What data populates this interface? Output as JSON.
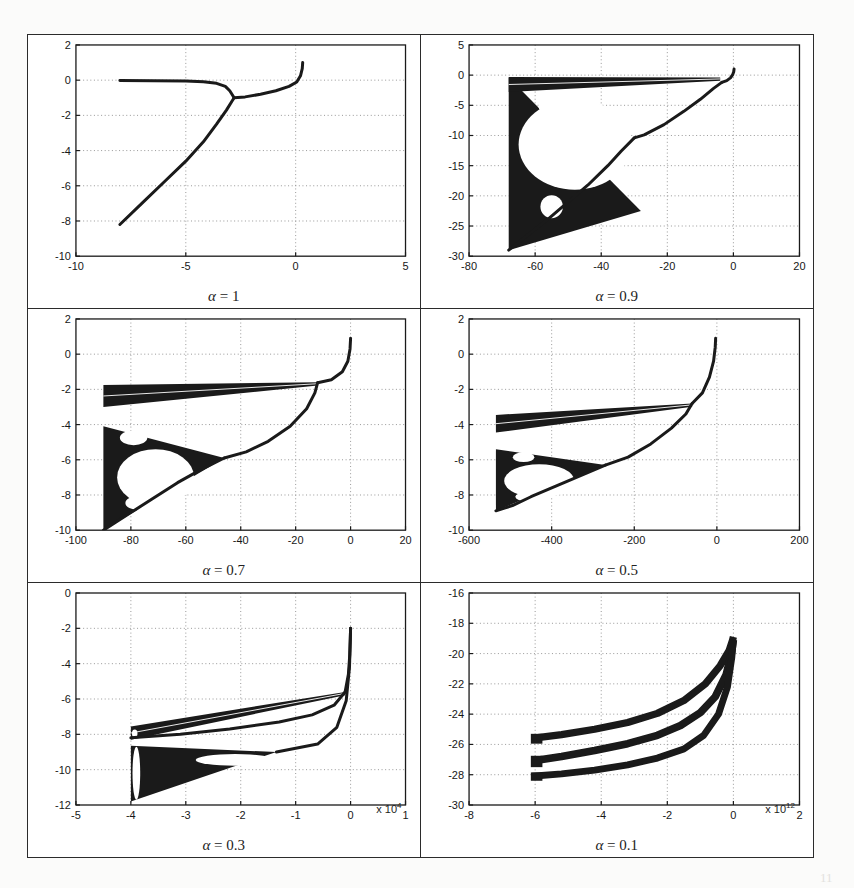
{
  "figure": {
    "kind": "bifurcation-diagram-grid",
    "rows": 3,
    "cols": 2,
    "background": "#ffffff",
    "ink": "#1a1a1a",
    "grid_color": "#9a9a9a"
  },
  "chart_data": [
    {
      "type": "scatter",
      "id": "panel-alpha-1",
      "title": "α = 1",
      "alpha_symbol": "α",
      "alpha_value": "1",
      "caption": "α = 1",
      "xlabel": "",
      "ylabel": "",
      "xlim": [
        -10,
        5
      ],
      "ylim": [
        -10,
        2
      ],
      "xticks": [
        -10,
        -5,
        0,
        5
      ],
      "xticklabels": [
        "-10",
        "-5",
        "0",
        "5"
      ],
      "yticks": [
        -10,
        -8,
        -6,
        -4,
        -2,
        0,
        2
      ],
      "yticklabels": [
        "-10",
        "-8",
        "-6",
        "-4",
        "-2",
        "0",
        "2"
      ],
      "grid": true,
      "x_exponent": "",
      "branches": [
        {
          "name": "flat-upper-branch",
          "points": [
            [
              -8.0,
              -0.02
            ],
            [
              -6.5,
              -0.03
            ],
            [
              -5.0,
              -0.05
            ],
            [
              -4.2,
              -0.09
            ],
            [
              -3.6,
              -0.18
            ],
            [
              -3.2,
              -0.35
            ],
            [
              -3.0,
              -0.6
            ],
            [
              -2.85,
              -0.9
            ],
            [
              -2.8,
              -1.0
            ]
          ]
        },
        {
          "name": "rising-right-branch",
          "points": [
            [
              -2.8,
              -1.0
            ],
            [
              -2.3,
              -0.95
            ],
            [
              -1.6,
              -0.8
            ],
            [
              -0.9,
              -0.6
            ],
            [
              -0.3,
              -0.35
            ],
            [
              0.05,
              -0.1
            ],
            [
              0.22,
              0.25
            ],
            [
              0.3,
              0.65
            ],
            [
              0.32,
              1.0
            ]
          ]
        },
        {
          "name": "diagonal-lower-branch",
          "points": [
            [
              -8.0,
              -8.2
            ],
            [
              -7.0,
              -7.0
            ],
            [
              -6.0,
              -5.8
            ],
            [
              -5.0,
              -4.6
            ],
            [
              -4.2,
              -3.5
            ],
            [
              -3.6,
              -2.5
            ],
            [
              -3.15,
              -1.7
            ],
            [
              -2.9,
              -1.2
            ],
            [
              -2.8,
              -1.0
            ]
          ]
        }
      ]
    },
    {
      "type": "scatter",
      "id": "panel-alpha-0-9",
      "title": "α = 0.9",
      "alpha_symbol": "α",
      "alpha_value": "0.9",
      "caption": "α = 0.9",
      "xlabel": "",
      "ylabel": "",
      "xlim": [
        -80,
        20
      ],
      "ylim": [
        -30,
        5
      ],
      "xticks": [
        -80,
        -60,
        -40,
        -20,
        0,
        20
      ],
      "xticklabels": [
        "-80",
        "-60",
        "-40",
        "-20",
        "0",
        "20"
      ],
      "yticks": [
        -30,
        -25,
        -20,
        -15,
        -10,
        -5,
        0,
        5
      ],
      "yticklabels": [
        "-30",
        "-25",
        "-20",
        "-15",
        "-10",
        "-5",
        "0",
        "5"
      ],
      "grid": true,
      "x_exponent": "",
      "chaotic_wedge": {
        "x_left": -68,
        "y_top": -0.4,
        "y_bottom": -29,
        "x_apex": -28,
        "y_apex": -22.5
      },
      "upper_band": {
        "x_left": -68,
        "x_right": -4,
        "y_left_top": -0.3,
        "y_left_bottom": -2.8,
        "y_right": -0.4
      },
      "eye_hole": {
        "cx": -48,
        "cy": -11.5,
        "rx": 17,
        "ry": 7.5
      },
      "small_hole": {
        "cx": -55,
        "cy": -21.8,
        "rx": 3.4,
        "ry": 1.9
      },
      "tiny_hole": {
        "cx": -56,
        "cy": -5.2,
        "rx": 3.0,
        "ry": 1.1
      },
      "branches": [
        {
          "name": "top-cusp",
          "points": [
            [
              -3.5,
              -1.2
            ],
            [
              -2.0,
              -0.9
            ],
            [
              -0.9,
              -0.45
            ],
            [
              -0.2,
              0.1
            ],
            [
              0.1,
              0.55
            ],
            [
              0.2,
              1.0
            ]
          ]
        },
        {
          "name": "right-descending",
          "points": [
            [
              -3.5,
              -1.2
            ],
            [
              -6,
              -2.2
            ],
            [
              -10,
              -4.0
            ],
            [
              -15,
              -6.0
            ],
            [
              -21,
              -8.2
            ],
            [
              -27,
              -9.9
            ],
            [
              -30,
              -10.4
            ]
          ]
        },
        {
          "name": "lower-right-arc",
          "points": [
            [
              -30,
              -10.4
            ],
            [
              -34,
              -12.6
            ],
            [
              -38,
              -15.0
            ],
            [
              -44,
              -18.2
            ],
            [
              -50,
              -21.0
            ],
            [
              -56,
              -23.8
            ],
            [
              -62,
              -26.4
            ],
            [
              -68,
              -29.0
            ]
          ]
        }
      ]
    },
    {
      "type": "scatter",
      "id": "panel-alpha-0-7",
      "title": "α = 0.7",
      "alpha_symbol": "α",
      "alpha_value": "0.7",
      "caption": "α = 0.7",
      "xlabel": "",
      "ylabel": "",
      "xlim": [
        -100,
        20
      ],
      "ylim": [
        -10,
        2
      ],
      "xticks": [
        -100,
        -80,
        -60,
        -40,
        -20,
        0,
        20
      ],
      "xticklabels": [
        "-100",
        "-80",
        "-60",
        "-40",
        "-20",
        "0",
        "20"
      ],
      "yticks": [
        -10,
        -8,
        -6,
        -4,
        -2,
        0,
        2
      ],
      "yticklabels": [
        "-10",
        "-8",
        "-6",
        "-4",
        "-2",
        "0",
        "2"
      ],
      "grid": true,
      "x_exponent": "",
      "upper_band": {
        "x_left": -90,
        "x_right": -12,
        "y_left_top": -1.75,
        "y_left_bottom": -3.0,
        "y_right": -1.6
      },
      "chaotic_wedge": {
        "x_left": -90,
        "y_top": -4.1,
        "y_bottom": -10.0,
        "x_apex": -46,
        "y_apex": -5.9
      },
      "eye_hole": {
        "cx": -71,
        "cy": -7.0,
        "rx": 14,
        "ry": 1.6
      },
      "small_hole": {
        "cx": -79,
        "cy": -4.75,
        "rx": 5.0,
        "ry": 0.42
      },
      "tiny_hole": {
        "cx": -77,
        "cy": -8.45,
        "rx": 5.0,
        "ry": 0.4
      },
      "branches": [
        {
          "name": "top-cusp",
          "points": [
            [
              -12,
              -1.62
            ],
            [
              -7,
              -1.45
            ],
            [
              -3,
              -1.0
            ],
            [
              -1,
              -0.4
            ],
            [
              -0.2,
              0.3
            ],
            [
              0.0,
              0.9
            ]
          ]
        },
        {
          "name": "right-descending",
          "points": [
            [
              -12,
              -1.62
            ],
            [
              -13,
              -2.2
            ],
            [
              -16,
              -3.1
            ],
            [
              -22,
              -4.1
            ],
            [
              -30,
              -4.95
            ],
            [
              -38,
              -5.55
            ],
            [
              -46,
              -5.9
            ]
          ]
        },
        {
          "name": "lower-right-arc",
          "points": [
            [
              -46,
              -5.9
            ],
            [
              -55,
              -6.6
            ],
            [
              -63,
              -7.3
            ],
            [
              -72,
              -8.2
            ],
            [
              -81,
              -9.1
            ],
            [
              -90,
              -10.0
            ]
          ]
        }
      ]
    },
    {
      "type": "scatter",
      "id": "panel-alpha-0-5",
      "title": "α = 0.5",
      "alpha_symbol": "α",
      "alpha_value": "0.5",
      "caption": "α = 0.5",
      "xlabel": "",
      "ylabel": "",
      "xlim": [
        -600,
        200
      ],
      "ylim": [
        -10,
        2
      ],
      "xticks": [
        -600,
        -400,
        -200,
        0,
        200
      ],
      "xticklabels": [
        "-600",
        "-400",
        "-200",
        "0",
        "200"
      ],
      "yticks": [
        -10,
        -8,
        -6,
        -4,
        -2,
        0,
        2
      ],
      "yticklabels": [
        "-10",
        "-8",
        "-6",
        "-4",
        "-2",
        "0",
        "2"
      ],
      "grid": true,
      "x_exponent": "",
      "upper_band": {
        "x_left": -535,
        "x_right": -60,
        "y_left_top": -3.45,
        "y_left_bottom": -4.45,
        "y_right": -2.8
      },
      "chaotic_wedge": {
        "x_left": -535,
        "y_top": -5.4,
        "y_bottom": -8.9,
        "x_apex": -270,
        "y_apex": -6.3
      },
      "eye_hole": {
        "cx": -430,
        "cy": -7.2,
        "rx": 85,
        "ry": 0.95
      },
      "small_hole": {
        "cx": -468,
        "cy": -5.85,
        "rx": 26,
        "ry": 0.28
      },
      "tiny_hole": {
        "cx": -460,
        "cy": -8.1,
        "rx": 28,
        "ry": 0.26
      },
      "branches": [
        {
          "name": "top-cusp",
          "points": [
            [
              -60,
              -2.8
            ],
            [
              -35,
              -2.2
            ],
            [
              -18,
              -1.3
            ],
            [
              -8,
              -0.4
            ],
            [
              -4,
              0.4
            ],
            [
              -3,
              0.9
            ]
          ]
        },
        {
          "name": "right-descending",
          "points": [
            [
              -60,
              -2.8
            ],
            [
              -75,
              -3.4
            ],
            [
              -110,
              -4.2
            ],
            [
              -160,
              -5.1
            ],
            [
              -215,
              -5.85
            ],
            [
              -270,
              -6.3
            ]
          ]
        },
        {
          "name": "lower-right-arc",
          "points": [
            [
              -270,
              -6.3
            ],
            [
              -330,
              -6.9
            ],
            [
              -390,
              -7.5
            ],
            [
              -450,
              -8.1
            ],
            [
              -495,
              -8.6
            ],
            [
              -535,
              -8.9
            ]
          ]
        }
      ]
    },
    {
      "type": "scatter",
      "id": "panel-alpha-0-3",
      "title": "α = 0.3",
      "alpha_symbol": "α",
      "alpha_value": "0.3",
      "caption": "α = 0.3",
      "xlabel": "",
      "ylabel": "",
      "xlim": [
        -5,
        1
      ],
      "ylim": [
        -12,
        0
      ],
      "xticks": [
        -5,
        -4,
        -3,
        -2,
        -1,
        0,
        1
      ],
      "xticklabels": [
        "-5",
        "-4",
        "-3",
        "-2",
        "-1",
        "0",
        "1"
      ],
      "yticks": [
        -12,
        -10,
        -8,
        -6,
        -4,
        -2,
        0
      ],
      "yticklabels": [
        "-12",
        "-10",
        "-8",
        "-6",
        "-4",
        "-2",
        "0"
      ],
      "grid": true,
      "x_exponent": "x 10",
      "x_exponent_power": "4",
      "upper_band": {
        "x_left": -4.0,
        "x_right": -0.1,
        "y_left_top": -7.55,
        "y_left_bottom": -8.3,
        "y_right": -5.6
      },
      "chaotic_wedge": {
        "x_left": -4.0,
        "y_top": -8.65,
        "y_bottom": -11.8,
        "x_apex": -1.35,
        "y_apex": -9.0
      },
      "eye_hole": {
        "cx": -2.1,
        "cy": -9.45,
        "rx": 0.72,
        "ry": 0.33
      },
      "small_hole": {
        "cx": -3.9,
        "cy": -10.2,
        "rx": 0.07,
        "ry": 1.5
      },
      "tiny_hole": {
        "cx": -3.93,
        "cy": -7.95,
        "rx": 0.05,
        "ry": 0.22
      },
      "branches": [
        {
          "name": "top-cusp",
          "points": [
            [
              -0.1,
              -5.6
            ],
            [
              -0.04,
              -4.6
            ],
            [
              -0.015,
              -3.5
            ],
            [
              -0.005,
              -2.6
            ],
            [
              0.0,
              -2.0
            ]
          ]
        },
        {
          "name": "right-descending",
          "points": [
            [
              -0.1,
              -5.6
            ],
            [
              -0.3,
              -6.35
            ],
            [
              -0.7,
              -6.9
            ],
            [
              -1.3,
              -7.3
            ],
            [
              -2.2,
              -7.7
            ],
            [
              -3.1,
              -8.0
            ],
            [
              -4.0,
              -8.2
            ]
          ]
        },
        {
          "name": "lower-right-arc",
          "points": [
            [
              0.0,
              -2.0
            ],
            [
              -0.02,
              -4.2
            ],
            [
              -0.08,
              -6.1
            ],
            [
              -0.25,
              -7.6
            ],
            [
              -0.6,
              -8.55
            ],
            [
              -1.35,
              -9.0
            ]
          ]
        }
      ]
    },
    {
      "type": "scatter",
      "id": "panel-alpha-0-1",
      "title": "α = 0.1",
      "alpha_symbol": "α",
      "alpha_value": "0.1",
      "caption": "α = 0.1",
      "xlabel": "",
      "ylabel": "",
      "xlim": [
        -8,
        2
      ],
      "ylim": [
        -30,
        -16
      ],
      "xticks": [
        -8,
        -6,
        -4,
        -2,
        0,
        2
      ],
      "xticklabels": [
        "-8",
        "-6",
        "-4",
        "-2",
        "0",
        "2"
      ],
      "yticks": [
        -30,
        -28,
        -26,
        -24,
        -22,
        -20,
        -18,
        -16
      ],
      "yticklabels": [
        "-30",
        "-28",
        "-26",
        "-24",
        "-22",
        "-20",
        "-18",
        "-16"
      ],
      "grid": true,
      "x_exponent": "x 10",
      "x_exponent_power": "12",
      "bands": [
        {
          "name": "band-upper",
          "left_x": -6.1,
          "left_y_top": -25.3,
          "left_y_bottom": -25.95,
          "points": [
            [
              -6.1,
              -25.6
            ],
            [
              -5.2,
              -25.35
            ],
            [
              -4.2,
              -25.0
            ],
            [
              -3.2,
              -24.55
            ],
            [
              -2.3,
              -23.95
            ],
            [
              -1.5,
              -23.1
            ],
            [
              -0.85,
              -22.0
            ],
            [
              -0.4,
              -20.8
            ],
            [
              -0.13,
              -19.8
            ],
            [
              -0.03,
              -19.15
            ],
            [
              0.0,
              -18.9
            ]
          ],
          "width": 0.48
        },
        {
          "name": "band-middle",
          "left_x": -6.1,
          "left_y_top": -26.75,
          "left_y_bottom": -27.5,
          "points": [
            [
              -6.1,
              -27.1
            ],
            [
              -5.2,
              -26.8
            ],
            [
              -4.2,
              -26.4
            ],
            [
              -3.2,
              -25.95
            ],
            [
              -2.3,
              -25.4
            ],
            [
              -1.6,
              -24.75
            ],
            [
              -1.0,
              -23.9
            ],
            [
              -0.55,
              -22.85
            ],
            [
              -0.22,
              -21.4
            ],
            [
              -0.06,
              -20.0
            ],
            [
              0.0,
              -19.1
            ]
          ],
          "width": 0.5
        },
        {
          "name": "band-lower",
          "left_x": -6.1,
          "left_y_top": -27.85,
          "left_y_bottom": -28.4,
          "points": [
            [
              -6.1,
              -28.1
            ],
            [
              -5.2,
              -27.95
            ],
            [
              -4.2,
              -27.7
            ],
            [
              -3.2,
              -27.35
            ],
            [
              -2.3,
              -26.9
            ],
            [
              -1.5,
              -26.3
            ],
            [
              -0.9,
              -25.4
            ],
            [
              -0.45,
              -24.0
            ],
            [
              -0.18,
              -22.2
            ],
            [
              -0.05,
              -20.3
            ],
            [
              0.0,
              -19.1
            ]
          ],
          "width": 0.45
        }
      ]
    }
  ],
  "ghost_text": [
    {
      "t": "1. Introduction",
      "x": 620,
      "y": 300
    },
    {
      "t": "stability of the",
      "x": 620,
      "y": 330
    },
    {
      "t": "(3.3)",
      "x": 40,
      "y": 372
    },
    {
      "t": "equation (3)",
      "x": 30,
      "y": 402
    },
    {
      "t": "and",
      "x": 30,
      "y": 438
    },
    {
      "t": "where",
      "x": 30,
      "y": 470
    },
    {
      "t": "The method",
      "x": 30,
      "y": 520
    },
    {
      "t": "follows",
      "x": 30,
      "y": 555
    },
    {
      "t": "11",
      "x": 820,
      "y": 870
    }
  ]
}
